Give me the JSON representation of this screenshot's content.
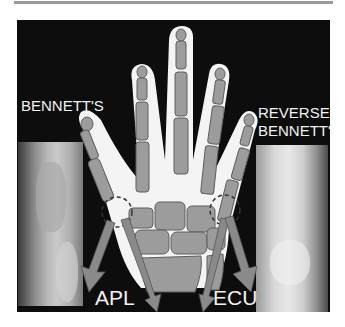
{
  "figure": {
    "labels": {
      "left_top": "BENNETT'S",
      "right_top_line1": "REVERSE",
      "right_top_line2": "BENNETT'S",
      "left_tendon": "APL",
      "right_tendon": "ECU"
    },
    "panels": {
      "left_xray": "Bennett's fracture radiograph (thumb base)",
      "right_xray": "Reverse Bennett's fracture radiograph (5th metacarpal base)",
      "center": "Schematic hand skeleton with tendon pull arrows"
    },
    "colors": {
      "background": "#0d0d0d",
      "hand_outline": "#f4f4f4",
      "bone": "#9c9c9c",
      "bone_edge": "#5e5e5e",
      "arrow": "#8a8a8a",
      "text": "#f2f2f2",
      "rule": "#9a9a9a"
    }
  }
}
